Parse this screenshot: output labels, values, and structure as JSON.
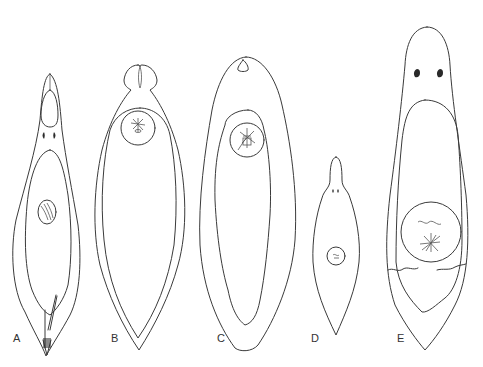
{
  "figure": {
    "type": "scientific-illustration",
    "stroke_color": "#3a3a3a",
    "background": "#ffffff",
    "panels": [
      {
        "id": "A",
        "label": "A",
        "features": [
          "elongate body",
          "anterior sucker/pharynx",
          "paired eyespots",
          "internal organ outline",
          "oval hatched gonad",
          "posterior copulatory apparatus"
        ]
      },
      {
        "id": "B",
        "label": "B",
        "features": [
          "bilobed head",
          "auricles",
          "round pharynx with radiating lines",
          "inner body outline",
          "pointed posterior"
        ]
      },
      {
        "id": "C",
        "label": "C",
        "features": [
          "anterior pore",
          "round pharynx with radiating lines",
          "wavy inner outline",
          "rounded posterior"
        ]
      },
      {
        "id": "D",
        "label": "D",
        "features": [
          "small body",
          "narrow head",
          "paired eyespots",
          "small round organ"
        ]
      },
      {
        "id": "E",
        "label": "E",
        "features": [
          "large body",
          "paired eyespots",
          "inner outline",
          "large round organ",
          "radiating lines",
          "paired ducts"
        ]
      }
    ]
  }
}
